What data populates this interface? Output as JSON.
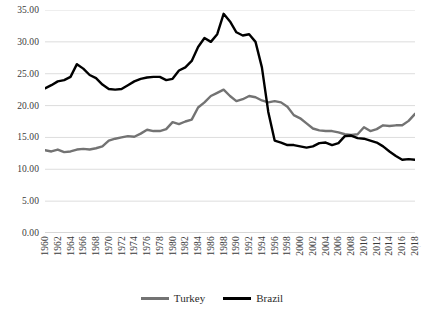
{
  "chart_data": {
    "type": "line",
    "title": "",
    "xlabel": "",
    "ylabel": "",
    "ylim": [
      0,
      35
    ],
    "xlim": [
      1960,
      2018
    ],
    "grid": true,
    "legend_position": "bottom",
    "y_ticks": [
      "0.00",
      "5.00",
      "10.00",
      "15.00",
      "20.00",
      "25.00",
      "30.00",
      "35.00"
    ],
    "y_tick_values": [
      0,
      5,
      10,
      15,
      20,
      25,
      30,
      35
    ],
    "x_ticks": [
      "1960",
      "1962",
      "1964",
      "1966",
      "1968",
      "1970",
      "1972",
      "1974",
      "1976",
      "1978",
      "1980",
      "1982",
      "1984",
      "1986",
      "1988",
      "1990",
      "1992",
      "1994",
      "1996",
      "1998",
      "2000",
      "2002",
      "2004",
      "2006",
      "2008",
      "2010",
      "2012",
      "2014",
      "2016",
      "2018"
    ],
    "x": [
      1960,
      1961,
      1962,
      1963,
      1964,
      1965,
      1966,
      1967,
      1968,
      1969,
      1970,
      1971,
      1972,
      1973,
      1974,
      1975,
      1976,
      1977,
      1978,
      1979,
      1980,
      1981,
      1982,
      1983,
      1984,
      1985,
      1986,
      1987,
      1988,
      1989,
      1990,
      1991,
      1992,
      1993,
      1994,
      1995,
      1996,
      1997,
      1998,
      1999,
      2000,
      2001,
      2002,
      2003,
      2004,
      2005,
      2006,
      2007,
      2008,
      2009,
      2010,
      2011,
      2012,
      2013,
      2014,
      2015,
      2016,
      2017,
      2018
    ],
    "series": [
      {
        "name": "Turkey",
        "color": "#737373",
        "values": [
          13.0,
          12.8,
          13.1,
          12.7,
          12.8,
          13.1,
          13.2,
          13.1,
          13.3,
          13.6,
          14.5,
          14.8,
          15.0,
          15.2,
          15.1,
          15.6,
          16.2,
          16.0,
          16.0,
          16.3,
          17.4,
          17.1,
          17.5,
          17.8,
          19.7,
          20.5,
          21.5,
          22.0,
          22.5,
          21.5,
          20.7,
          21.0,
          21.5,
          21.3,
          20.8,
          20.5,
          20.7,
          20.5,
          19.8,
          18.5,
          18.0,
          17.2,
          16.4,
          16.1,
          16.0,
          16.0,
          15.8,
          15.5,
          15.4,
          15.5,
          16.6,
          16.0,
          16.3,
          16.9,
          16.8,
          16.9,
          16.9,
          17.6,
          18.7
        ]
      },
      {
        "name": "Brazil",
        "color": "#000000",
        "values": [
          22.7,
          23.2,
          23.8,
          24.0,
          24.5,
          26.5,
          25.8,
          24.8,
          24.3,
          23.3,
          22.6,
          22.5,
          22.6,
          23.2,
          23.8,
          24.2,
          24.4,
          24.5,
          24.5,
          24.0,
          24.2,
          25.5,
          26.0,
          27.0,
          29.2,
          30.6,
          30.0,
          31.2,
          34.4,
          33.2,
          31.5,
          31.0,
          31.2,
          30.0,
          26.0,
          19.0,
          14.5,
          14.2,
          13.8,
          13.8,
          13.6,
          13.4,
          13.6,
          14.1,
          14.2,
          13.8,
          14.1,
          15.2,
          15.3,
          14.9,
          14.8,
          14.5,
          14.2,
          13.6,
          12.8,
          12.1,
          11.5,
          11.6,
          11.5
        ]
      }
    ]
  },
  "legend": {
    "items": [
      {
        "label": "Turkey",
        "color": "#737373"
      },
      {
        "label": "Brazil",
        "color": "#000000"
      }
    ]
  },
  "corner_mark": "∙∙"
}
